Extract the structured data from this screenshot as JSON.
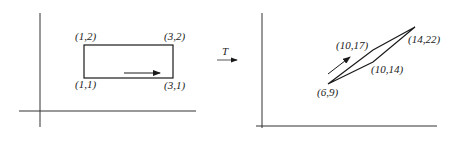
{
  "diagram": {
    "transform_label": "T",
    "domain_plot": {
      "shape": "rectangle",
      "vertices": [
        {
          "label": "(1,2)",
          "x": 1,
          "y": 2
        },
        {
          "label": "(3,2)",
          "x": 3,
          "y": 2
        },
        {
          "label": "(1,1)",
          "x": 1,
          "y": 1
        },
        {
          "label": "(3,1)",
          "x": 3,
          "y": 1
        }
      ],
      "direction_arrow": "right"
    },
    "codomain_plot": {
      "shape": "parallelogram",
      "vertices": [
        {
          "label": "(6,9)",
          "x": 6,
          "y": 9
        },
        {
          "label": "(10,17)",
          "x": 10,
          "y": 17
        },
        {
          "label": "(14,22)",
          "x": 14,
          "y": 22
        },
        {
          "label": "(10,14)",
          "x": 10,
          "y": 14
        }
      ],
      "direction_arrow": "up-right"
    },
    "colors": {
      "stroke": "#1a1a1a",
      "axis": "#333333",
      "background": "#ffffff"
    }
  }
}
